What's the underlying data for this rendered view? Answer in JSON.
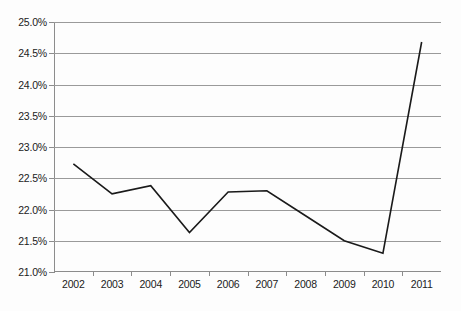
{
  "chart_data": {
    "type": "line",
    "title": "",
    "subtitle": "",
    "xlabel": "",
    "ylabel": "",
    "categories": [
      "2002",
      "2003",
      "2004",
      "2005",
      "2006",
      "2007",
      "2008",
      "2009",
      "2010",
      "2011"
    ],
    "series": [
      {
        "name": "",
        "values": [
          22.73,
          22.25,
          22.38,
          21.63,
          22.28,
          22.3,
          21.9,
          21.5,
          21.3,
          24.68
        ]
      }
    ],
    "ylim": [
      21.0,
      25.0
    ],
    "ytick_values": [
      21.0,
      21.5,
      22.0,
      22.5,
      23.0,
      23.5,
      24.0,
      24.5,
      25.0
    ],
    "ytick_labels": [
      "21.0%",
      "21.5%",
      "22.0%",
      "22.5%",
      "23.0%",
      "23.5%",
      "24.0%",
      "24.5%",
      "25.0%"
    ],
    "xtick_labels": [
      "2002",
      "2003",
      "2004",
      "2005",
      "2006",
      "2007",
      "2008",
      "2009",
      "2010",
      "2011"
    ],
    "grid": true,
    "grid_axis": "y",
    "legend": false,
    "legend_position": "none",
    "line_color": "#1a1a1a",
    "line_width": 1.6,
    "markers": false,
    "background_color": "#fdfdfd",
    "grid_color": "#9a9a9a",
    "axis_color": "#8c8c8c",
    "text_color": "#1b1b1b"
  }
}
